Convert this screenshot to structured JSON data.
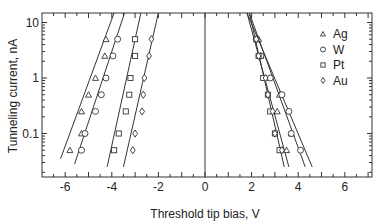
{
  "chart_data": {
    "type": "scatter",
    "title": "",
    "xlabel": "Threshold tip bias, V",
    "ylabel": "Tunneling current, nA",
    "xlim": [
      -7,
      7
    ],
    "ylim": [
      0.02,
      15
    ],
    "yscale": "log",
    "grid": false,
    "legend_position": "upper right",
    "x_ticks": [
      "-6",
      "-4",
      "-2",
      "0",
      "2",
      "4",
      "6"
    ],
    "y_ticks": [
      "0.1",
      "1",
      "10"
    ],
    "vertical_line_at_x": 0,
    "series": [
      {
        "name": "Ag",
        "marker": "triangle",
        "negative": [
          [
            -4.25,
            5
          ],
          [
            -4.3,
            2.5
          ],
          [
            -4.7,
            1.0
          ],
          [
            -5.0,
            0.5
          ],
          [
            -5.3,
            0.25
          ],
          [
            -5.3,
            0.1
          ],
          [
            -5.8,
            0.05
          ]
        ],
        "positive": [
          [
            2.3,
            5
          ],
          [
            2.4,
            2.5
          ],
          [
            2.6,
            1.0
          ],
          [
            3.2,
            0.5
          ],
          [
            3.1,
            0.25
          ],
          [
            3.7,
            0.1
          ],
          [
            3.5,
            0.05
          ]
        ]
      },
      {
        "name": "W",
        "marker": "circle",
        "negative": [
          [
            -3.75,
            5
          ],
          [
            -3.95,
            2.5
          ],
          [
            -4.25,
            1.0
          ],
          [
            -4.45,
            0.5
          ],
          [
            -4.7,
            0.25
          ],
          [
            -5.15,
            0.1
          ],
          [
            -5.3,
            0.05
          ]
        ],
        "positive": [
          [
            2.2,
            5
          ],
          [
            2.4,
            2.5
          ],
          [
            2.8,
            1.0
          ],
          [
            3.3,
            0.5
          ],
          [
            3.6,
            0.25
          ],
          [
            3.7,
            0.1
          ],
          [
            4.1,
            0.05
          ]
        ]
      },
      {
        "name": "Pt",
        "marker": "square",
        "negative": [
          [
            -3.0,
            5
          ],
          [
            -3.0,
            2.5
          ],
          [
            -3.2,
            1.0
          ],
          [
            -3.25,
            0.5
          ],
          [
            -3.4,
            0.25
          ],
          [
            -3.7,
            0.1
          ],
          [
            -3.9,
            0.05
          ]
        ],
        "positive": [
          [
            2.2,
            5
          ],
          [
            2.3,
            2.5
          ],
          [
            2.5,
            1.0
          ],
          [
            2.7,
            0.5
          ],
          [
            2.8,
            0.25
          ],
          [
            3.0,
            0.1
          ],
          [
            3.2,
            0.05
          ]
        ]
      },
      {
        "name": "Au",
        "marker": "diamond",
        "negative": [
          [
            -2.3,
            5
          ],
          [
            -2.4,
            2.5
          ],
          [
            -2.6,
            1.0
          ],
          [
            -2.65,
            0.5
          ],
          [
            -2.7,
            0.25
          ],
          [
            -3.0,
            0.1
          ],
          [
            -3.1,
            0.05
          ]
        ],
        "positive": [
          [
            2.2,
            5
          ],
          [
            2.3,
            2.5
          ],
          [
            2.6,
            1.0
          ],
          [
            2.7,
            0.5
          ],
          [
            2.9,
            0.25
          ],
          [
            3.0,
            0.1
          ],
          [
            3.3,
            0.05
          ]
        ]
      }
    ],
    "fit_lines": [
      {
        "series": "Ag",
        "side": "negative",
        "from": [
          -6.2,
          0.035
        ],
        "to": [
          -3.9,
          15
        ]
      },
      {
        "series": "W",
        "side": "negative",
        "from": [
          -5.6,
          0.028
        ],
        "to": [
          -3.45,
          15
        ]
      },
      {
        "series": "Pt",
        "side": "negative",
        "from": [
          -4.2,
          0.025
        ],
        "to": [
          -2.75,
          15
        ]
      },
      {
        "series": "Au",
        "side": "negative",
        "from": [
          -3.5,
          0.025
        ],
        "to": [
          -2.0,
          15
        ]
      },
      {
        "series": "Ag",
        "side": "positive",
        "from": [
          1.9,
          15
        ],
        "to": [
          4.3,
          0.025
        ]
      },
      {
        "series": "W",
        "side": "positive",
        "from": [
          1.8,
          15
        ],
        "to": [
          4.6,
          0.025
        ]
      },
      {
        "series": "Pt",
        "side": "positive",
        "from": [
          1.9,
          15
        ],
        "to": [
          3.4,
          0.025
        ]
      },
      {
        "series": "Au",
        "side": "positive",
        "from": [
          1.8,
          15
        ],
        "to": [
          3.6,
          0.025
        ]
      }
    ]
  }
}
